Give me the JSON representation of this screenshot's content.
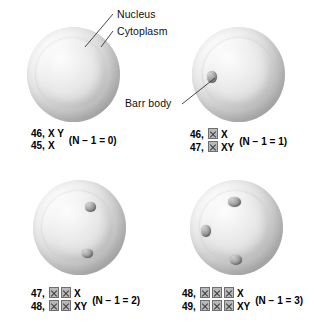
{
  "figure": {
    "background_color": "#ffffff",
    "cell_fill_color": "#dcdcdc",
    "nucleus_fill_color": "#ebebeb",
    "barr_body_color": "#8e8e8e"
  },
  "callouts": [
    {
      "id": "nucleus",
      "label": "Nucleus"
    },
    {
      "id": "cytoplasm",
      "label": "Cytoplasm"
    },
    {
      "id": "barr-body",
      "label": "Barr body"
    }
  ],
  "cells": [
    {
      "id": "cell-1",
      "barr_body_count": 0,
      "karyotype_lines": [
        {
          "chromosome_number": "46,",
          "inactive_x": 0,
          "sex_chromosomes": "X Y"
        },
        {
          "chromosome_number": "45,",
          "inactive_x": 0,
          "sex_chromosomes": "X"
        }
      ],
      "n_minus_one": "(N − 1 = 0)",
      "n_value": 0
    },
    {
      "id": "cell-2",
      "barr_body_count": 1,
      "karyotype_lines": [
        {
          "chromosome_number": "46,",
          "inactive_x": 1,
          "sex_chromosomes": "X"
        },
        {
          "chromosome_number": "47,",
          "inactive_x": 1,
          "sex_chromosomes": "XY"
        }
      ],
      "n_minus_one": "(N − 1 = 1)",
      "n_value": 1
    },
    {
      "id": "cell-3",
      "barr_body_count": 2,
      "karyotype_lines": [
        {
          "chromosome_number": "47,",
          "inactive_x": 2,
          "sex_chromosomes": "X"
        },
        {
          "chromosome_number": "48,",
          "inactive_x": 2,
          "sex_chromosomes": "XY"
        }
      ],
      "n_minus_one": "(N − 1 = 2)",
      "n_value": 2
    },
    {
      "id": "cell-4",
      "barr_body_count": 3,
      "karyotype_lines": [
        {
          "chromosome_number": "48,",
          "inactive_x": 3,
          "sex_chromosomes": "X"
        },
        {
          "chromosome_number": "49,",
          "inactive_x": 3,
          "sex_chromosomes": "XY"
        }
      ],
      "n_minus_one": "(N − 1 = 3)",
      "n_value": 3
    }
  ]
}
